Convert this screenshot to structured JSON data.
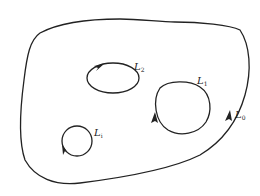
{
  "diagram": {
    "type": "region-with-contours",
    "stroke_color": "#222222",
    "background": "#ffffff",
    "contours": [
      {
        "id": "L0",
        "label": "L",
        "subscript": "0",
        "role": "outer boundary",
        "orientation": "counterclockwise"
      },
      {
        "id": "L1",
        "label": "L",
        "subscript": "1",
        "role": "inner contour",
        "orientation": "clockwise"
      },
      {
        "id": "L2",
        "label": "L",
        "subscript": "2",
        "role": "inner contour",
        "orientation": "clockwise"
      },
      {
        "id": "Li",
        "label": "L",
        "subscript": "i",
        "role": "inner contour",
        "orientation": "clockwise"
      }
    ]
  }
}
